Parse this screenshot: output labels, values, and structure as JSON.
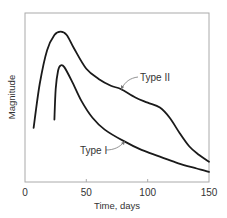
{
  "chart_data": {
    "type": "line",
    "title": "",
    "xlabel": "Time, days",
    "ylabel": "Magnitude",
    "xlim": [
      0,
      150
    ],
    "ylim": [
      0,
      100
    ],
    "x_ticks": [
      0,
      50,
      100,
      150
    ],
    "x_tick_labels": [
      "0",
      "50",
      "100",
      "150"
    ],
    "y_ticks": [],
    "grid": false,
    "legend": "inline annotations with leader lines",
    "series": [
      {
        "name": "Type II",
        "x": [
          7,
          12,
          18,
          24,
          29,
          34,
          40,
          50,
          60,
          70,
          78,
          90,
          100,
          110,
          118,
          126,
          134,
          142,
          150
        ],
        "values": [
          32,
          58,
          78,
          87,
          89,
          87,
          79,
          67,
          61,
          57,
          55,
          50,
          47,
          44,
          38,
          29,
          21,
          16,
          12
        ]
      },
      {
        "name": "Type I",
        "x": [
          24,
          25,
          27,
          29,
          32,
          38,
          46,
          55,
          65,
          81,
          95,
          110,
          125,
          140,
          150
        ],
        "values": [
          37,
          55,
          66,
          69,
          68,
          60,
          48,
          38,
          31,
          24,
          19,
          15,
          11,
          8,
          6
        ]
      }
    ],
    "annotations": [
      {
        "text": "Type II",
        "x": 93,
        "y": 62
      },
      {
        "text": "Type I",
        "x": 45,
        "y": 18
      }
    ]
  }
}
